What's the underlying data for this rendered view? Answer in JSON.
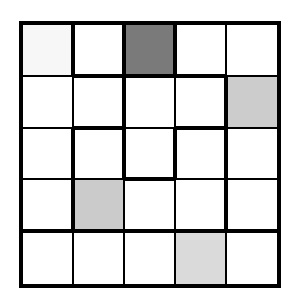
{
  "puzzle": {
    "rows": 5,
    "cols": 5,
    "col_edges": [
      0,
      52,
      103,
      154,
      205,
      258
    ],
    "row_edges": [
      0,
      53,
      105,
      156,
      208,
      263
    ],
    "thin": 1.5,
    "thick": 3.5,
    "cells": [
      [
        "#f7f7f7",
        "#ffffff",
        "#7a7a7a",
        "#ffffff",
        "#ffffff"
      ],
      [
        "#ffffff",
        "#ffffff",
        "#ffffff",
        "#ffffff",
        "#cccccc"
      ],
      [
        "#ffffff",
        "#ffffff",
        "#ffffff",
        "#ffffff",
        "#ffffff"
      ],
      [
        "#ffffff",
        "#cbcbcb",
        "#ffffff",
        "#ffffff",
        "#ffffff"
      ],
      [
        "#ffffff",
        "#ffffff",
        "#ffffff",
        "#dadada",
        "#ffffff"
      ]
    ],
    "vertical_thick": [
      [
        true,
        true,
        true,
        false
      ],
      [
        false,
        true,
        false,
        true
      ],
      [
        true,
        true,
        true,
        true
      ],
      [
        true,
        false,
        false,
        true
      ],
      [
        false,
        false,
        false,
        false
      ]
    ],
    "horizontal_thick": [
      [
        false,
        true,
        true,
        true,
        false
      ],
      [
        false,
        true,
        false,
        true,
        false
      ],
      [
        false,
        false,
        true,
        false,
        false
      ],
      [
        true,
        true,
        true,
        true,
        true
      ]
    ]
  }
}
